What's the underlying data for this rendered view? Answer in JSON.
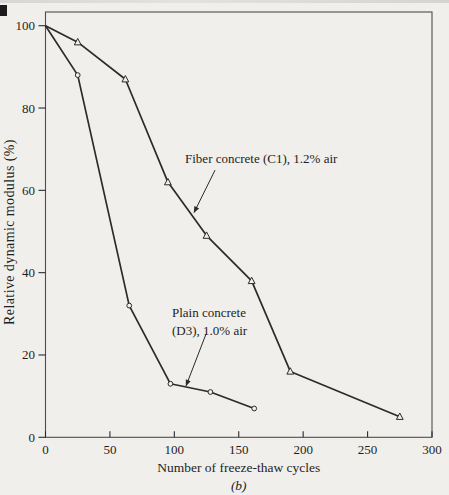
{
  "figure": {
    "caption": "(b)",
    "background_color": "#f1efec",
    "line_color": "#2b2b2b",
    "text_color": "#1e1e1e",
    "frame_color": "#4d4d4d"
  },
  "chart_data": {
    "type": "line",
    "title": "",
    "xlabel": "Number of freeze-thaw cycles",
    "ylabel": "Relative dynamic modulus (%)",
    "xlim": [
      0,
      300
    ],
    "ylim": [
      0,
      100
    ],
    "x_ticks": [
      0,
      50,
      100,
      150,
      200,
      250,
      300
    ],
    "y_ticks": [
      0,
      20,
      40,
      60,
      80,
      100
    ],
    "grid": false,
    "legend_position": "none",
    "series": [
      {
        "name": "Fiber concrete (C1), 1.2% air",
        "marker": "triangle",
        "x": [
          0,
          25,
          62,
          95,
          125,
          160,
          190,
          275
        ],
        "y": [
          100,
          96,
          87,
          62,
          49,
          38,
          16,
          5
        ]
      },
      {
        "name": "Plain concrete (D3), 1.0% air",
        "marker": "circle",
        "x": [
          0,
          25,
          65,
          97,
          128,
          162
        ],
        "y": [
          100,
          88,
          32,
          13,
          11,
          7
        ]
      }
    ],
    "annotations": [
      {
        "id": "fiber-label",
        "lines": [
          "Fiber concrete (C1), 1.2% air"
        ],
        "text_x": 108.3,
        "text_y": 66.6,
        "arrow_from": [
          131.6,
          64.9
        ],
        "arrow_to": [
          115.3,
          54.6
        ]
      },
      {
        "id": "plain-label",
        "lines": [
          "Plain concrete",
          "(D3), 1.0% air"
        ],
        "text_x": 98.2,
        "text_y": 29.2,
        "arrow_from": [
          124.6,
          25.1
        ],
        "arrow_to": [
          109.1,
          12.5
        ]
      }
    ]
  }
}
